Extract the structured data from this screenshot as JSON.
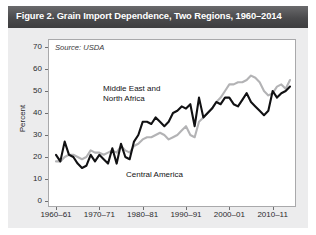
{
  "figure": {
    "title": "Figure 2. Grain Import Dependence, Two Regions, 1960–2014",
    "source_note": "Source: USDA",
    "header_color": "#4a4a4c",
    "body_color": "#ececed",
    "plot_background": "#ffffff"
  },
  "chart_data": {
    "type": "line",
    "title": "Figure 2. Grain Import Dependence, Two Regions, 1960–2014",
    "subtitle": "Source: USDA",
    "xlabel": "",
    "ylabel": "Percent",
    "xlim": [
      1960,
      2014
    ],
    "ylim": [
      0,
      70
    ],
    "ytick_values": [
      0,
      10,
      20,
      30,
      40,
      50,
      60,
      70
    ],
    "ytick_labels": [
      "0",
      "10",
      "20",
      "30",
      "40",
      "50",
      "60",
      "70"
    ],
    "xtick_values": [
      1960,
      1970,
      1980,
      1990,
      2000,
      2010
    ],
    "xtick_labels": [
      "1960–61",
      "1970–71",
      "1980–81",
      "1990–91",
      "2000–01",
      "2010–11"
    ],
    "grid": false,
    "legend": "inline-annotations",
    "x": [
      1960,
      1961,
      1962,
      1963,
      1964,
      1965,
      1966,
      1967,
      1968,
      1969,
      1970,
      1971,
      1972,
      1973,
      1974,
      1975,
      1976,
      1977,
      1978,
      1979,
      1980,
      1981,
      1982,
      1983,
      1984,
      1985,
      1986,
      1987,
      1988,
      1989,
      1990,
      1991,
      1992,
      1993,
      1994,
      1995,
      1996,
      1997,
      1998,
      1999,
      2000,
      2001,
      2002,
      2003,
      2004,
      2005,
      2006,
      2007,
      2008,
      2009,
      2010,
      2011,
      2012,
      2013,
      2014
    ],
    "series": [
      {
        "name": "Middle East and North Africa",
        "color": "#111113",
        "line_width": 2.1,
        "label_position": {
          "x": 95,
          "y": 78
        },
        "values": [
          21,
          18,
          27,
          21,
          20,
          17,
          15,
          16,
          21,
          18,
          21,
          19,
          17,
          24,
          17,
          26,
          20,
          19,
          27,
          30,
          36,
          36,
          35,
          38,
          36,
          34,
          36,
          40,
          41,
          43,
          42,
          44,
          34,
          47,
          38,
          40,
          42,
          45,
          44,
          47,
          47,
          44,
          43,
          46,
          49,
          45,
          43,
          41,
          39,
          41,
          50,
          47,
          49,
          50,
          52
        ]
      },
      {
        "name": "Central America",
        "color": "#b3b3b5",
        "line_width": 2.1,
        "label_position": {
          "x": 118,
          "y": 164
        },
        "values": [
          18,
          18,
          20,
          21,
          21,
          20,
          19,
          20,
          23,
          22,
          22,
          21,
          22,
          23,
          22,
          25,
          23,
          22,
          25,
          26,
          28,
          29,
          29,
          30,
          31,
          30,
          28,
          29,
          30,
          32,
          34,
          30,
          29,
          36,
          38,
          40,
          42,
          45,
          47,
          50,
          53,
          53,
          54,
          54,
          55,
          57,
          56,
          54,
          50,
          48,
          49,
          52,
          53,
          51,
          55
        ]
      }
    ],
    "annotations": [
      {
        "text": "Middle East and North Africa",
        "series": "Middle East and North Africa"
      },
      {
        "text": "Central America",
        "series": "Central America"
      }
    ]
  },
  "axis": {
    "ylabel": "Percent",
    "ytick_labels": [
      "70",
      "60",
      "50",
      "40",
      "30",
      "20",
      "10",
      "0"
    ],
    "xtick_labels": [
      "1960–61",
      "1970–71",
      "1980–81",
      "1990–91",
      "2000–01",
      "2010–11"
    ]
  },
  "annotations": {
    "mena_line1": "Middle East and",
    "mena_line2": "North Africa",
    "central_america": "Central America"
  }
}
